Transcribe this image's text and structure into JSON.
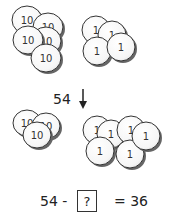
{
  "diagram": {
    "top": {
      "tens_group": {
        "coin_value": "10",
        "count": 5
      },
      "ones_group": {
        "coin_value": "1",
        "count": 4
      }
    },
    "transition": {
      "label": "54",
      "arrow": "down-arrow-icon"
    },
    "bottom": {
      "tens_group": {
        "coin_value": "10",
        "count": 3
      },
      "ones_group": {
        "coin_value": "1",
        "count": 6
      }
    },
    "equation": {
      "left": "54 -",
      "unknown": "?",
      "right": "= 36"
    },
    "colors": {
      "coin_fill": "#ffffff",
      "coin_stroke": "#333333",
      "shadow": "#555555",
      "text": "#222222"
    }
  }
}
